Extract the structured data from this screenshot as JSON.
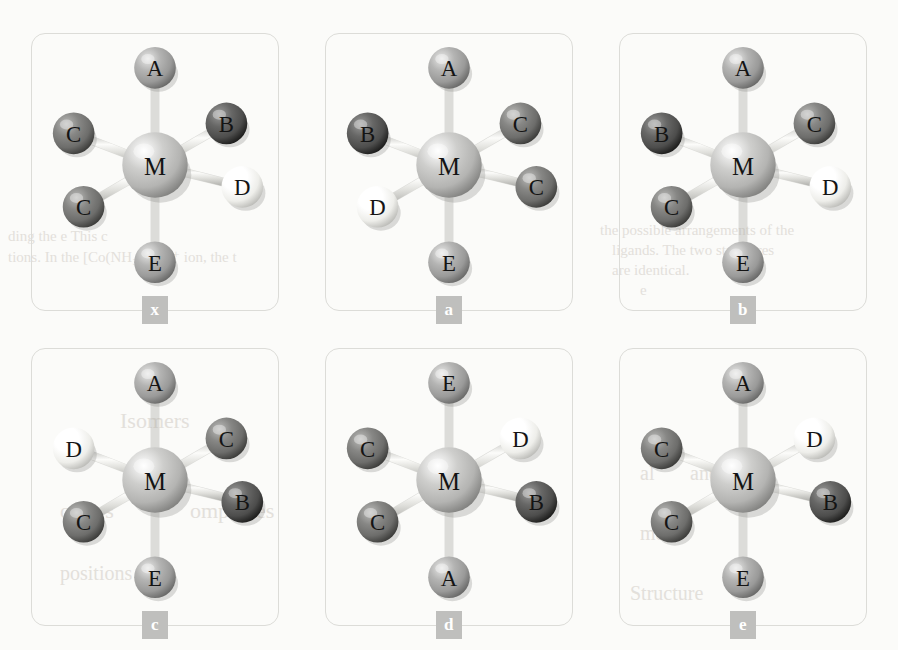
{
  "figure": {
    "type": "molecular-geometry-diagram",
    "panel_count": 6,
    "center_atom": "M",
    "ligand_labels": [
      "A",
      "B",
      "C",
      "C",
      "D",
      "E"
    ],
    "colors": {
      "background": "#fbfbf9",
      "card_border": "#dcdcd8",
      "badge_bg": "#bfbfbd",
      "badge_text": "#ffffff",
      "atom_M": "#b4b4b2",
      "atom_A": "#9a9a99",
      "atom_B": "#4d4d4c",
      "atom_C": "#6d6d6b",
      "atom_D": "#eeeeea",
      "atom_E": "#9a9a99",
      "bond": "#d8d8d4",
      "label_text": "#141414"
    },
    "positions": [
      "top",
      "upper-left",
      "lower-left",
      "upper-right",
      "right",
      "bottom"
    ]
  },
  "panels": [
    {
      "id": "x",
      "badge": "x",
      "atoms": {
        "center": "M",
        "top": "A",
        "upper_left": "C",
        "lower_left": "C",
        "upper_right": "B",
        "right": "D",
        "bottom": "E"
      }
    },
    {
      "id": "a",
      "badge": "a",
      "atoms": {
        "center": "M",
        "top": "A",
        "upper_left": "B",
        "lower_left": "D",
        "upper_right": "C",
        "right": "C",
        "bottom": "E"
      }
    },
    {
      "id": "b",
      "badge": "b",
      "atoms": {
        "center": "M",
        "top": "A",
        "upper_left": "B",
        "lower_left": "C",
        "upper_right": "C",
        "right": "D",
        "bottom": "E"
      }
    },
    {
      "id": "c",
      "badge": "c",
      "atoms": {
        "center": "M",
        "top": "A",
        "upper_left": "D",
        "lower_left": "C",
        "upper_right": "C",
        "right": "B",
        "bottom": "E"
      }
    },
    {
      "id": "d",
      "badge": "d",
      "atoms": {
        "center": "M",
        "top": "E",
        "upper_left": "C",
        "lower_left": "C",
        "upper_right": "D",
        "right": "B",
        "bottom": "A"
      }
    },
    {
      "id": "e",
      "badge": "e",
      "atoms": {
        "center": "M",
        "top": "A",
        "upper_left": "C",
        "lower_left": "C",
        "upper_right": "D",
        "right": "B",
        "bottom": "E"
      }
    }
  ],
  "ghost_text": [
    {
      "text": "ding the e   This c",
      "x": 8,
      "y": 228,
      "size": 15
    },
    {
      "text": "tions. In the [Co(NH₃)₄Cl₂]⁺ ion, the t",
      "x": 8,
      "y": 248,
      "size": 15
    },
    {
      "text": "the possible arrangements of the",
      "x": 600,
      "y": 222,
      "size": 15
    },
    {
      "text": "ligands. The two structures",
      "x": 612,
      "y": 242,
      "size": 15
    },
    {
      "text": "are identical.",
      "x": 612,
      "y": 262,
      "size": 15
    },
    {
      "text": "e",
      "x": 640,
      "y": 282,
      "size": 15
    },
    {
      "text": "Isomers",
      "x": 120,
      "y": 408,
      "size": 22
    },
    {
      "text": "omers",
      "x": 60,
      "y": 498,
      "size": 22
    },
    {
      "text": "omplexes",
      "x": 190,
      "y": 498,
      "size": 22
    },
    {
      "text": "positions",
      "x": 60,
      "y": 562,
      "size": 20
    },
    {
      "text": "al",
      "x": 640,
      "y": 462,
      "size": 20
    },
    {
      "text": "and",
      "x": 690,
      "y": 462,
      "size": 20
    },
    {
      "text": "mers",
      "x": 640,
      "y": 522,
      "size": 20
    },
    {
      "text": "Structure",
      "x": 630,
      "y": 582,
      "size": 20
    }
  ]
}
